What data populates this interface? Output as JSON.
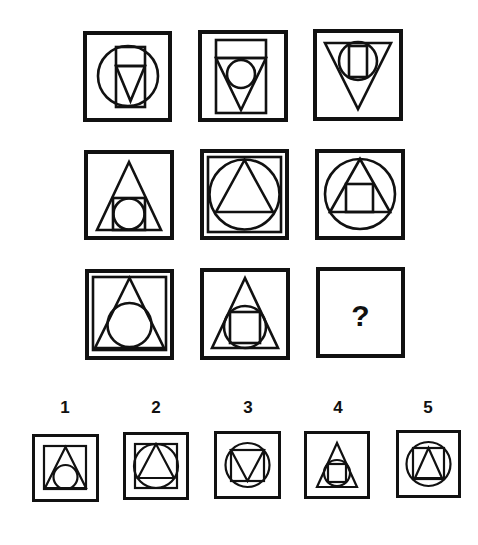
{
  "puzzle": {
    "stroke_color": "#111111",
    "background": "#ffffff",
    "question_mark": "?",
    "grid": [
      {
        "id": "r1c1",
        "x": 83,
        "y": 31,
        "w": 89,
        "h": 91,
        "frame": 4,
        "desc": "circle containing a rectangle with downward triangle in lower part",
        "shapes": [
          {
            "t": "circle",
            "cx": 45,
            "cy": 45,
            "r": 30
          },
          {
            "t": "rect",
            "x": 33,
            "y": 16,
            "w": 29,
            "h": 60
          },
          {
            "t": "line",
            "x1": 33,
            "y1": 35,
            "x2": 62,
            "y2": 35
          },
          {
            "t": "poly",
            "pts": "33,35 62,35 47.5,70"
          }
        ]
      },
      {
        "id": "r1c2",
        "x": 198,
        "y": 30,
        "w": 90,
        "h": 92,
        "frame": 4,
        "desc": "rectangle containing downward triangle with inscribed circle",
        "shapes": [
          {
            "t": "rect",
            "x": 18,
            "y": 10,
            "w": 50,
            "h": 73
          },
          {
            "t": "line",
            "x1": 18,
            "y1": 28,
            "x2": 68,
            "y2": 28
          },
          {
            "t": "poly",
            "pts": "18,28 68,28 43,80"
          },
          {
            "t": "circle",
            "cx": 43,
            "cy": 44,
            "r": 14
          }
        ]
      },
      {
        "id": "r1c3",
        "x": 313,
        "y": 29,
        "w": 90,
        "h": 92,
        "frame": 4,
        "desc": "downward triangle containing circle with rectangle inside",
        "shapes": [
          {
            "t": "poly",
            "pts": "12,14 78,14 45,80"
          },
          {
            "t": "circle",
            "cx": 45,
            "cy": 32,
            "r": 19
          },
          {
            "t": "rect",
            "x": 36,
            "y": 17,
            "w": 18,
            "h": 31
          }
        ]
      },
      {
        "id": "r2c1",
        "x": 84,
        "y": 150,
        "w": 90,
        "h": 90,
        "frame": 4,
        "desc": "upward triangle containing square with inscribed circle",
        "shapes": [
          {
            "t": "poly",
            "pts": "13,80 77,80 45,12"
          },
          {
            "t": "rect",
            "x": 29,
            "y": 48,
            "w": 32,
            "h": 32
          },
          {
            "t": "circle",
            "cx": 45,
            "cy": 64,
            "r": 15.5
          }
        ]
      },
      {
        "id": "r2c2",
        "x": 200,
        "y": 149,
        "w": 89,
        "h": 91,
        "frame": 4,
        "desc": "double frame, square containing circle with inscribed upward triangle",
        "shapes": [
          {
            "t": "rect",
            "x": 8,
            "y": 8,
            "w": 73,
            "h": 75
          },
          {
            "t": "circle",
            "cx": 44.5,
            "cy": 45.5,
            "r": 35
          },
          {
            "t": "poly",
            "pts": "44.5,11 16,63 73,63"
          }
        ]
      },
      {
        "id": "r2c3",
        "x": 315,
        "y": 149,
        "w": 90,
        "h": 91,
        "frame": 4,
        "desc": "circle containing upward triangle with square inside",
        "shapes": [
          {
            "t": "circle",
            "cx": 45,
            "cy": 45,
            "r": 35
          },
          {
            "t": "poly",
            "pts": "45,10 15,63 75,63"
          },
          {
            "t": "rect",
            "x": 31,
            "y": 35,
            "w": 27,
            "h": 28
          }
        ]
      },
      {
        "id": "r3c1",
        "x": 85,
        "y": 269,
        "w": 89,
        "h": 91,
        "frame": 4,
        "desc": "double frame, square containing upward triangle with inscribed circle",
        "shapes": [
          {
            "t": "rect",
            "x": 8,
            "y": 8,
            "w": 73,
            "h": 73
          },
          {
            "t": "poly",
            "pts": "44.5,9 10,79 79,79"
          },
          {
            "t": "circle",
            "cx": 44.5,
            "cy": 56,
            "r": 22
          }
        ]
      },
      {
        "id": "r3c2",
        "x": 200,
        "y": 268,
        "w": 90,
        "h": 92,
        "frame": 4,
        "desc": "upward triangle containing circle with inscribed square",
        "shapes": [
          {
            "t": "poly",
            "pts": "45,10 12,80 78,80"
          },
          {
            "t": "circle",
            "cx": 45,
            "cy": 59,
            "r": 21
          },
          {
            "t": "rect",
            "x": 30,
            "y": 44,
            "w": 30,
            "h": 31
          }
        ]
      },
      {
        "id": "r3c3",
        "x": 316,
        "y": 267,
        "w": 89,
        "h": 91,
        "frame": 4,
        "desc": "empty cell with question mark",
        "question": true,
        "shapes": []
      }
    ],
    "options": [
      {
        "label": "1",
        "label_x": 50,
        "label_y": 398,
        "x": 32,
        "y": 434,
        "w": 67,
        "h": 68,
        "frame": 3,
        "desc": "square containing upward triangle with circle",
        "shapes": [
          {
            "t": "rect",
            "x": 12,
            "y": 12,
            "w": 42,
            "h": 43
          },
          {
            "t": "poly",
            "pts": "33.5,13 13,54 54,54"
          },
          {
            "t": "circle",
            "cx": 33.5,
            "cy": 43,
            "r": 12
          }
        ]
      },
      {
        "label": "2",
        "label_x": 141,
        "label_y": 398,
        "x": 123,
        "y": 432,
        "w": 66,
        "h": 68,
        "frame": 3,
        "desc": "square containing circle with upward triangle",
        "shapes": [
          {
            "t": "rect",
            "x": 12,
            "y": 12,
            "w": 42,
            "h": 44
          },
          {
            "t": "circle",
            "cx": 33,
            "cy": 34,
            "r": 22
          },
          {
            "t": "poly",
            "pts": "33,12 15,46 51,46"
          }
        ]
      },
      {
        "label": "3",
        "label_x": 233,
        "label_y": 398,
        "x": 214,
        "y": 431,
        "w": 67,
        "h": 68,
        "frame": 3,
        "desc": "circle containing square with downward triangle",
        "shapes": [
          {
            "t": "circle",
            "cx": 33.5,
            "cy": 34,
            "r": 22
          },
          {
            "t": "rect",
            "x": 17,
            "y": 19,
            "w": 33,
            "h": 31
          },
          {
            "t": "poly",
            "pts": "17,19 50,19 33.5,50"
          }
        ]
      },
      {
        "label": "4",
        "label_x": 323,
        "label_y": 398,
        "x": 304,
        "y": 431,
        "w": 66,
        "h": 68,
        "frame": 3,
        "desc": "upward triangle containing circle with square",
        "shapes": [
          {
            "t": "poly",
            "pts": "33,12 13,56 53,56"
          },
          {
            "t": "circle",
            "cx": 33,
            "cy": 42,
            "r": 13
          },
          {
            "t": "rect",
            "x": 24,
            "y": 33,
            "w": 18,
            "h": 18
          }
        ]
      },
      {
        "label": "5",
        "label_x": 413,
        "label_y": 398,
        "x": 396,
        "y": 430,
        "w": 65,
        "h": 68,
        "frame": 3,
        "desc": "circle containing square with upward triangle",
        "shapes": [
          {
            "t": "circle",
            "cx": 32.5,
            "cy": 34,
            "r": 22
          },
          {
            "t": "rect",
            "x": 17,
            "y": 18,
            "w": 31,
            "h": 31
          },
          {
            "t": "poly",
            "pts": "32.5,18 19,48 46,48"
          }
        ]
      }
    ]
  }
}
